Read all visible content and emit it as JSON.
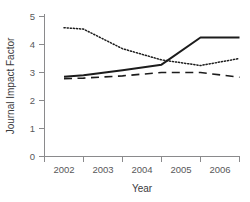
{
  "chart_data": {
    "type": "line",
    "title": "",
    "xlabel": "Year",
    "ylabel": "Journal Impact Factor",
    "categories": [
      "2002",
      "2003",
      "2004",
      "2005",
      "2006"
    ],
    "x": [
      2002,
      2003,
      2004,
      2005,
      2006
    ],
    "xlim": [
      2001.5,
      2006.5
    ],
    "ylim": [
      0,
      5
    ],
    "yticks": [
      0,
      1,
      2,
      3,
      4,
      5
    ],
    "yticklabels": [
      "0",
      "1",
      "2",
      "3",
      "4",
      "5"
    ],
    "xticklabels": [
      "2002",
      "2003",
      "2004",
      "2005",
      "2006"
    ],
    "grid": false,
    "legend": "none",
    "series": [
      {
        "name": "solid-series",
        "style": "solid",
        "color": "#1c1c1c",
        "x": [
          2002.0,
          2002.5,
          2003.5,
          2004.5,
          2005.5,
          2006.5
        ],
        "values": [
          2.85,
          2.9,
          3.08,
          3.28,
          4.25,
          4.25
        ]
      },
      {
        "name": "dotted-series",
        "style": "dotted",
        "color": "#1c1c1c",
        "x": [
          2002.0,
          2002.5,
          2003.5,
          2004.5,
          2005.5,
          2006.5
        ],
        "values": [
          4.6,
          4.55,
          3.85,
          3.45,
          3.25,
          3.5
        ]
      },
      {
        "name": "dashed-series",
        "style": "dashed",
        "color": "#1c1c1c",
        "x": [
          2002.0,
          2002.5,
          2003.5,
          2004.5,
          2005.5,
          2006.5
        ],
        "values": [
          2.78,
          2.8,
          2.88,
          3.0,
          3.0,
          2.83
        ]
      }
    ]
  },
  "axes": {
    "y_title": "Journal Impact Factor",
    "x_title": "Year",
    "y_tick_labels": [
      "5",
      "4",
      "3",
      "2",
      "1",
      "0"
    ],
    "x_tick_labels": [
      "2002",
      "2003",
      "2004",
      "2005",
      "2006"
    ]
  },
  "colors": {
    "line": "#1c1c1c",
    "axis": "#8a8a8c",
    "tick_text": "#58585a",
    "background": "#ffffff"
  }
}
